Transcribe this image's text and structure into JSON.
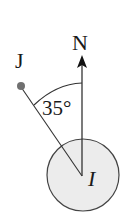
{
  "diagram": {
    "points": {
      "J": {
        "label": "J",
        "x": 21,
        "y": 86
      },
      "I": {
        "label": "I",
        "x": 82,
        "y": 175
      },
      "N": {
        "label": "N"
      }
    },
    "angle": {
      "value": "35°",
      "between": [
        "IJ",
        "IN"
      ]
    },
    "colors": {
      "circle_fill": "#ececec",
      "stroke": "#333333",
      "dot": "#707070"
    }
  }
}
